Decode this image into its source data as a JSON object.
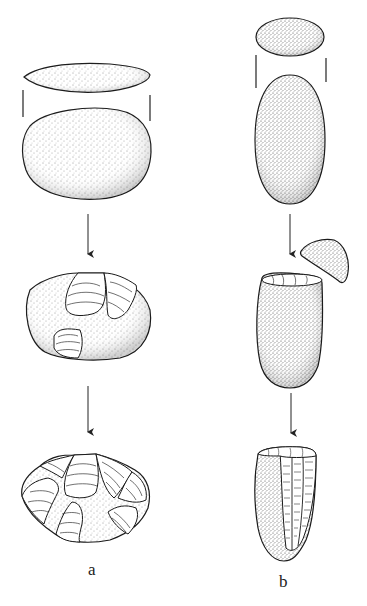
{
  "figure": {
    "type": "illustration",
    "background_color": "#ffffff",
    "ink_color": "#1a1a1a",
    "columns": [
      {
        "id": "a",
        "label": "a",
        "stages": [
          {
            "name": "pebble-side-view",
            "description": "flat lens-shaped cobble, side profile"
          },
          {
            "name": "pebble-plan-view",
            "description": "rounded oval cobble, plan view"
          },
          {
            "name": "arrow",
            "icon": "down-arrow-icon"
          },
          {
            "name": "initial-flaking",
            "description": "cobble with first flake scars removed"
          },
          {
            "name": "arrow",
            "icon": "down-arrow-icon"
          },
          {
            "name": "discoidal-core",
            "description": "core with flake scars around the periphery"
          }
        ]
      },
      {
        "id": "b",
        "label": "b",
        "stages": [
          {
            "name": "pebble-end-view",
            "description": "small oval cross-section"
          },
          {
            "name": "pebble-plan-view",
            "description": "elongated oval cobble"
          },
          {
            "name": "arrow",
            "icon": "down-arrow-icon"
          },
          {
            "name": "decapitation",
            "description": "top cap removed to form striking platform"
          },
          {
            "name": "arrow",
            "icon": "down-arrow-icon"
          },
          {
            "name": "blade-core",
            "description": "prismatic core with parallel blade scars"
          }
        ]
      }
    ]
  },
  "labels": {
    "a": "a",
    "b": "b"
  }
}
